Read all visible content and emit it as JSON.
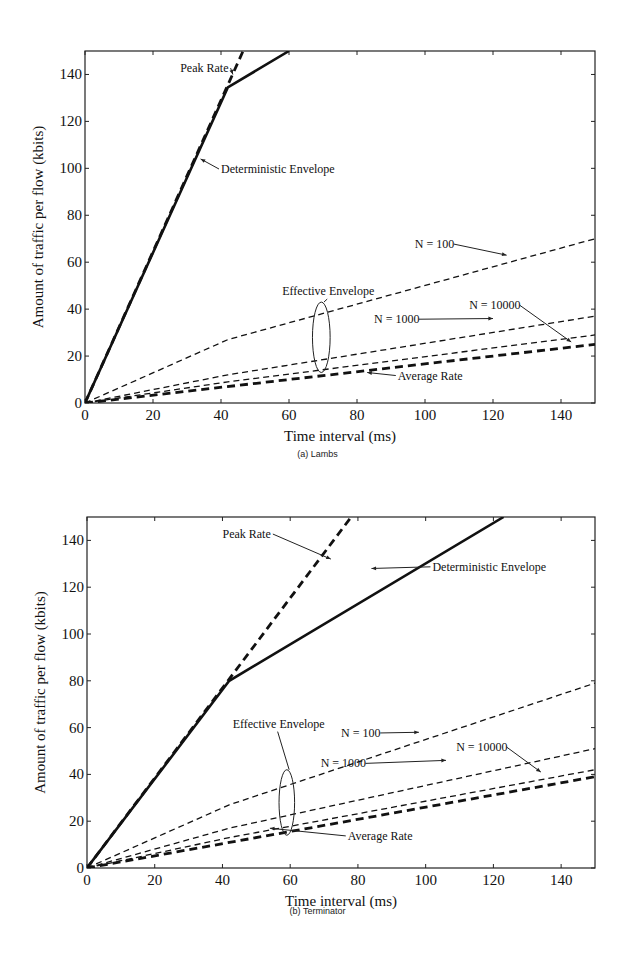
{
  "chart_data": [
    {
      "type": "line",
      "title": "",
      "caption": "(a)  Lambs",
      "xlabel": "Time interval (ms)",
      "ylabel": "Amount of traffic per flow (kbits)",
      "xlim": [
        0,
        150
      ],
      "ylim": [
        0,
        150
      ],
      "xticks": [
        0,
        20,
        40,
        60,
        80,
        100,
        120,
        140
      ],
      "yticks": [
        0,
        20,
        40,
        60,
        80,
        100,
        120,
        140
      ],
      "grid": false,
      "series": [
        {
          "name": "Peak Rate",
          "style": "dashed-thick",
          "x": [
            0,
            46.5
          ],
          "y": [
            0,
            150
          ]
        },
        {
          "name": "Deterministic Envelope",
          "style": "solid-thick",
          "x": [
            0,
            42,
            60
          ],
          "y": [
            0,
            134.5,
            150
          ]
        },
        {
          "name": "N = 100",
          "style": "dashed",
          "x": [
            0,
            42,
            150
          ],
          "y": [
            0,
            27,
            70
          ]
        },
        {
          "name": "N = 1000",
          "style": "dashed",
          "x": [
            0,
            42,
            150
          ],
          "y": [
            0,
            12,
            37
          ]
        },
        {
          "name": "N = 10000",
          "style": "dashed",
          "x": [
            0,
            42,
            150
          ],
          "y": [
            0,
            9,
            29
          ]
        },
        {
          "name": "Average Rate",
          "style": "dashed-thick",
          "x": [
            0,
            150
          ],
          "y": [
            0,
            25
          ]
        }
      ],
      "annotations": [
        {
          "text": "Peak Rate",
          "x": 28,
          "y": 141
        },
        {
          "text": "Deterministic Envelope",
          "x": 40,
          "y": 98
        },
        {
          "text": "Effective Envelope",
          "x": 58,
          "y": 46
        },
        {
          "text": "N = 100",
          "x": 97,
          "y": 66
        },
        {
          "text": "N = 1000",
          "x": 85,
          "y": 34
        },
        {
          "text": "N = 10000",
          "x": 113,
          "y": 40
        },
        {
          "text": "Average Rate",
          "x": 92,
          "y": 10
        }
      ]
    },
    {
      "type": "line",
      "title": "",
      "caption": "(b)  Terminator",
      "xlabel": "Time interval (ms)",
      "ylabel": "Amount of traffic per flow (kbits)",
      "xlim": [
        0,
        150
      ],
      "ylim": [
        0,
        150
      ],
      "xticks": [
        0,
        20,
        40,
        60,
        80,
        100,
        120,
        140
      ],
      "yticks": [
        0,
        20,
        40,
        60,
        80,
        100,
        120,
        140
      ],
      "grid": false,
      "series": [
        {
          "name": "Peak Rate",
          "style": "dashed-thick",
          "x": [
            0,
            78
          ],
          "y": [
            0,
            150
          ]
        },
        {
          "name": "Deterministic Envelope",
          "style": "solid-thick",
          "x": [
            0,
            42,
            123
          ],
          "y": [
            0,
            80,
            150
          ]
        },
        {
          "name": "N = 100",
          "style": "dashed",
          "x": [
            0,
            42,
            150
          ],
          "y": [
            0,
            27,
            79
          ]
        },
        {
          "name": "N = 1000",
          "style": "dashed",
          "x": [
            0,
            42,
            150
          ],
          "y": [
            0,
            17,
            51
          ]
        },
        {
          "name": "N = 10000",
          "style": "dashed",
          "x": [
            0,
            42,
            150
          ],
          "y": [
            0,
            13,
            42
          ]
        },
        {
          "name": "Average Rate",
          "style": "dashed-thick",
          "x": [
            0,
            150
          ],
          "y": [
            0,
            39
          ]
        }
      ],
      "annotations": [
        {
          "text": "Peak Rate",
          "x": 40,
          "y": 141
        },
        {
          "text": "Deterministic Envelope",
          "x": 102,
          "y": 127
        },
        {
          "text": "Effective Envelope",
          "x": 43,
          "y": 60
        },
        {
          "text": "N = 100",
          "x": 75,
          "y": 56
        },
        {
          "text": "N = 1000",
          "x": 69,
          "y": 43
        },
        {
          "text": "N = 10000",
          "x": 109,
          "y": 50
        },
        {
          "text": "Average Rate",
          "x": 77,
          "y": 12
        }
      ]
    }
  ],
  "panels": [
    {
      "caption": "(a)  Lambs",
      "xlabel": "Time interval (ms)",
      "ylabel": "Amount of traffic per flow (kbits)"
    },
    {
      "caption": "(b)  Terminator",
      "xlabel": "Time interval (ms)",
      "ylabel": "Amount of traffic per flow (kbits)"
    }
  ]
}
